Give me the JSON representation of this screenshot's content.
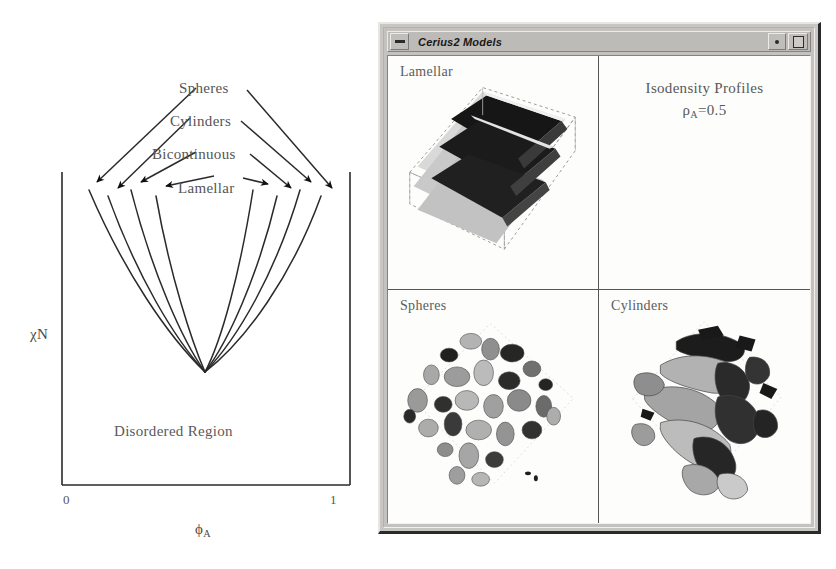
{
  "figure": {
    "phase_diagram": {
      "name": "block copolymer phase diagram",
      "phase_labels": [
        "Spheres",
        "Cylinders",
        "Bicontinuous",
        "Lamellar"
      ],
      "region_label": "Disordered Region",
      "y_axis_label": "χN",
      "x_axis_label_base": "ϕ",
      "x_axis_label_sub": "A",
      "x_tick_min": "0",
      "x_tick_max": "1",
      "arrow_count": 8,
      "curve_count": 8
    }
  },
  "window": {
    "title": "Cerius2 Models",
    "menu_icon": "window-menu-icon",
    "minimize_icon": "minimize-dot-icon",
    "maximize_icon": "maximize-box-icon",
    "quadrants": [
      {
        "id": "lamellar",
        "label": "Lamellar",
        "art": "lamellar-slabs-3d"
      },
      {
        "id": "isodensity",
        "label": "",
        "heading_line_1": "Isodensity Profiles",
        "heading_line_2_base": "ρ",
        "heading_line_2_sub": "A",
        "heading_line_2_tail": "=0.5",
        "art": "none"
      },
      {
        "id": "spheres",
        "label": "Spheres",
        "art": "spheres-isosurface"
      },
      {
        "id": "cylinders",
        "label": "Cylinders",
        "art": "cylinders-isosurface"
      }
    ]
  },
  "colors": {
    "page_background": "#ffffff",
    "window_chrome": "#c8c6c2",
    "titlebar": "#bdbbb7",
    "canvas": "#fdfdfc",
    "ink": "#1a1a1a",
    "text_gray": "#5a5a5a",
    "art_dark": "#1d1d1d",
    "art_mid": "#9a9a9a",
    "art_light": "#d4d4d4"
  }
}
